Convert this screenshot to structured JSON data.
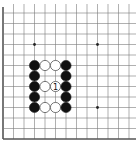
{
  "diagram": {
    "type": "go-board-fragment",
    "grid": {
      "x_lines": [
        3,
        13.5,
        24,
        34.5,
        45,
        55.5,
        66,
        76.5,
        87,
        97.5,
        108,
        118.5,
        129
      ],
      "y_lines": [
        13,
        23.5,
        34,
        44.5,
        55,
        65.5,
        76,
        86.5,
        97,
        107.5,
        118,
        128.5,
        139
      ],
      "edges": [
        "left",
        "bottom"
      ],
      "line_color": "#7a7a7a",
      "edge_color": "#555555"
    },
    "star_points": [
      {
        "col": 3,
        "row": 3
      },
      {
        "col": 9,
        "row": 3
      },
      {
        "col": 9,
        "row": 9
      }
    ],
    "stones": [
      {
        "color": "black",
        "col": 3,
        "row": 5
      },
      {
        "color": "white",
        "col": 4,
        "row": 5
      },
      {
        "color": "white",
        "col": 5,
        "row": 5
      },
      {
        "color": "black",
        "col": 6,
        "row": 5
      },
      {
        "color": "black",
        "col": 3,
        "row": 6
      },
      {
        "color": "black",
        "col": 6,
        "row": 6
      },
      {
        "color": "black",
        "col": 3,
        "row": 7
      },
      {
        "color": "white",
        "col": 4,
        "row": 7
      },
      {
        "color": "white",
        "col": 5,
        "row": 7,
        "label": "1"
      },
      {
        "color": "black",
        "col": 6,
        "row": 7
      },
      {
        "color": "black",
        "col": 3,
        "row": 8
      },
      {
        "color": "black",
        "col": 6,
        "row": 8
      },
      {
        "color": "black",
        "col": 3,
        "row": 9
      },
      {
        "color": "white",
        "col": 4,
        "row": 9
      },
      {
        "color": "white",
        "col": 5,
        "row": 9
      },
      {
        "color": "black",
        "col": 6,
        "row": 9
      }
    ]
  }
}
